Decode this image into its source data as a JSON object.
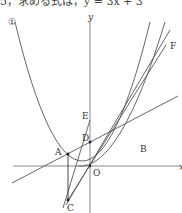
{
  "top_text": "5，求める式は，y = 3x + 3",
  "diagram": {
    "curve_label": "①",
    "axis_y_label": "y",
    "axis_x_label": "x",
    "points": {
      "A": "A",
      "B": "B",
      "C": "C",
      "D": "D",
      "E": "E",
      "F": "F",
      "O": "O"
    },
    "colors": {
      "line": "#555555",
      "axis": "#888888",
      "text": "#333333"
    }
  }
}
